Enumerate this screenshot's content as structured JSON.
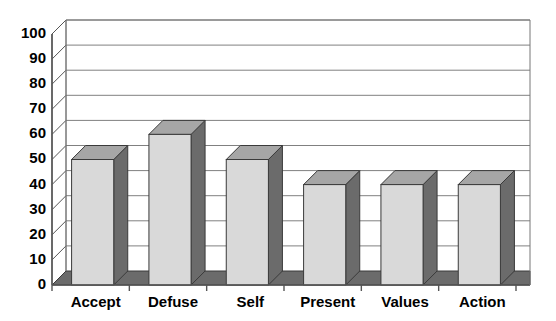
{
  "chart_data": {
    "type": "bar",
    "title": "",
    "subtitle": "",
    "xlabel": "",
    "ylabel": "",
    "categories": [
      "Accept",
      "Defuse",
      "Self",
      "Present",
      "Values",
      "Action"
    ],
    "values": [
      50,
      60,
      50,
      40,
      40,
      40
    ],
    "ylim": [
      0,
      100
    ],
    "ytick_labels": [
      "0",
      "10",
      "20",
      "30",
      "40",
      "50",
      "60",
      "70",
      "80",
      "90",
      "100"
    ],
    "ytick_values": [
      0,
      10,
      20,
      30,
      40,
      50,
      60,
      70,
      80,
      90,
      100
    ],
    "grid": true,
    "grid_axis": "y",
    "legend": false,
    "legend_position": "none",
    "style": "3d-column",
    "annotations": [],
    "colors": {
      "bar_front": "#d9d9d9",
      "bar_side": "#6b6b6b",
      "bar_top": "#a6a6a6",
      "bar_outline": "#3a3a3a",
      "floor": "#6b6b6b",
      "gridline": "#808080",
      "axis": "#555555",
      "plot_background": "#ffffff",
      "text": "#000000"
    }
  }
}
